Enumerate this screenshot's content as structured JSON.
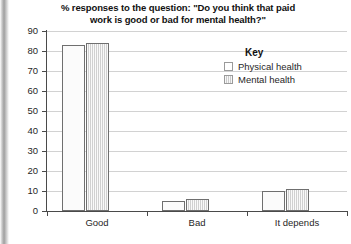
{
  "chart_data": {
    "type": "bar",
    "title": "% responses to the question: \"Do you think that paid work is good or bad for mental health?\"",
    "title_lines": [
      "% responses to the question: \"Do you think that paid",
      "work is good or bad for mental health?\""
    ],
    "categories": [
      "Good",
      "Bad",
      "It depends"
    ],
    "series": [
      {
        "name": "Physical health",
        "values": [
          83,
          5,
          10
        ],
        "color": "#fbfbfb"
      },
      {
        "name": "Mental health",
        "values": [
          84,
          6,
          11
        ],
        "color": "#d9d9d9"
      }
    ],
    "xlabel": "",
    "ylabel": "",
    "ylim": [
      0,
      90
    ],
    "ytick_step": 10,
    "yticks": [
      0,
      10,
      20,
      30,
      40,
      50,
      60,
      70,
      80,
      90
    ],
    "ytick_labels": [
      "0",
      "10",
      "20",
      "30",
      "40",
      "50",
      "60",
      "70",
      "80",
      "90"
    ],
    "grid": true,
    "grid_axis": "y",
    "legend": {
      "title": "Key",
      "position": "inside-top-right",
      "entries": [
        "Physical health",
        "Mental health"
      ]
    }
  }
}
